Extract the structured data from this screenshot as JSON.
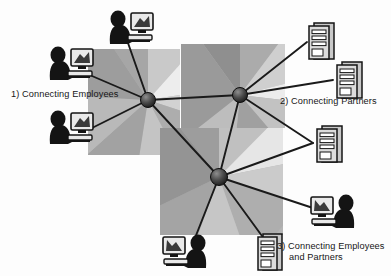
{
  "diagram": {
    "type": "network-topology",
    "background": "#ffffff",
    "colors": {
      "line": "#1a1a1a",
      "node_dark": "#2b2b2b",
      "node_light": "#9a9a9a",
      "icon_silhouette": "#141414",
      "icon_device": "#d8d8d8",
      "square_base": "#b3b3b3",
      "square_light": "#e4e4e4",
      "square_dark": "#8e8e8e",
      "text": "#161616"
    },
    "labels": [
      {
        "id": "label-1",
        "text": "1) Connecting Employees"
      },
      {
        "id": "label-2",
        "text": "2) Connecting Partners"
      },
      {
        "id": "label-3",
        "line1": "3) Connecting Employees",
        "line2": "and Partners"
      }
    ],
    "hubs": [
      {
        "id": "hub-employees",
        "name": "left-hub-node",
        "cx": 148,
        "cy": 100,
        "r": 7.5
      },
      {
        "id": "hub-partners",
        "name": "right-hub-node",
        "cx": 240,
        "cy": 95,
        "r": 7.5
      },
      {
        "id": "hub-both",
        "name": "bottom-hub-node",
        "cx": 219,
        "cy": 177,
        "r": 8.5
      }
    ],
    "squares": [
      {
        "id": "square-employees",
        "x": 88,
        "y": 49,
        "w": 92,
        "h": 106,
        "center_x": 148,
        "center_y": 100
      },
      {
        "id": "square-partners",
        "x": 181,
        "y": 44,
        "w": 104,
        "h": 84,
        "center_x": 240,
        "center_y": 95
      },
      {
        "id": "square-both",
        "x": 160,
        "y": 128,
        "w": 123,
        "h": 107,
        "center_x": 219,
        "center_y": 177
      }
    ],
    "endpoints": [
      {
        "id": "employee-top",
        "kind": "person-computer",
        "flip": false,
        "x": 104,
        "y": 8,
        "w": 50,
        "h": 40,
        "link_x": 128,
        "link_y": 43
      },
      {
        "id": "employee-upper",
        "kind": "person-computer",
        "flip": false,
        "x": 44,
        "y": 44,
        "w": 52,
        "h": 40,
        "link_x": 92,
        "link_y": 76
      },
      {
        "id": "employee-lower",
        "kind": "person-computer",
        "flip": false,
        "x": 44,
        "y": 108,
        "w": 52,
        "h": 40,
        "link_x": 92,
        "link_y": 128
      },
      {
        "id": "partner-top",
        "kind": "server-tower",
        "flip": false,
        "x": 303,
        "y": 19,
        "w": 40,
        "h": 42,
        "link_x": 307,
        "link_y": 42
      },
      {
        "id": "partner-middle",
        "kind": "server-tower",
        "flip": false,
        "x": 331,
        "y": 58,
        "w": 40,
        "h": 42,
        "link_x": 333,
        "link_y": 80
      },
      {
        "id": "partner-bottom",
        "kind": "server-tower",
        "flip": false,
        "x": 311,
        "y": 122,
        "w": 40,
        "h": 42,
        "link_x": 313,
        "link_y": 143
      },
      {
        "id": "mixed-right",
        "kind": "person-computer",
        "flip": true,
        "x": 308,
        "y": 192,
        "w": 52,
        "h": 42,
        "link_x": 313,
        "link_y": 208
      },
      {
        "id": "mixed-bottom-person",
        "kind": "person-computer",
        "flip": true,
        "x": 160,
        "y": 232,
        "w": 52,
        "h": 42,
        "link_x": 195,
        "link_y": 238
      },
      {
        "id": "mixed-bottom-server",
        "kind": "server-tower",
        "flip": false,
        "x": 252,
        "y": 230,
        "w": 38,
        "h": 42,
        "link_x": 262,
        "link_y": 236
      }
    ],
    "links": [
      {
        "from": "hub-employees",
        "to": "hub-partners"
      },
      {
        "from": "hub-employees",
        "to": "hub-both"
      },
      {
        "from": "hub-partners",
        "to": "hub-both"
      },
      {
        "from": "hub-employees",
        "to": "employee-top"
      },
      {
        "from": "hub-employees",
        "to": "employee-upper"
      },
      {
        "from": "hub-employees",
        "to": "employee-lower"
      },
      {
        "from": "hub-partners",
        "to": "partner-top"
      },
      {
        "from": "hub-partners",
        "to": "partner-middle"
      },
      {
        "from": "hub-partners",
        "to": "partner-bottom"
      },
      {
        "from": "hub-both",
        "to": "mixed-right"
      },
      {
        "from": "hub-both",
        "to": "mixed-bottom-person"
      },
      {
        "from": "hub-both",
        "to": "mixed-bottom-server"
      },
      {
        "from": "hub-both",
        "to": "partner-bottom"
      }
    ]
  }
}
